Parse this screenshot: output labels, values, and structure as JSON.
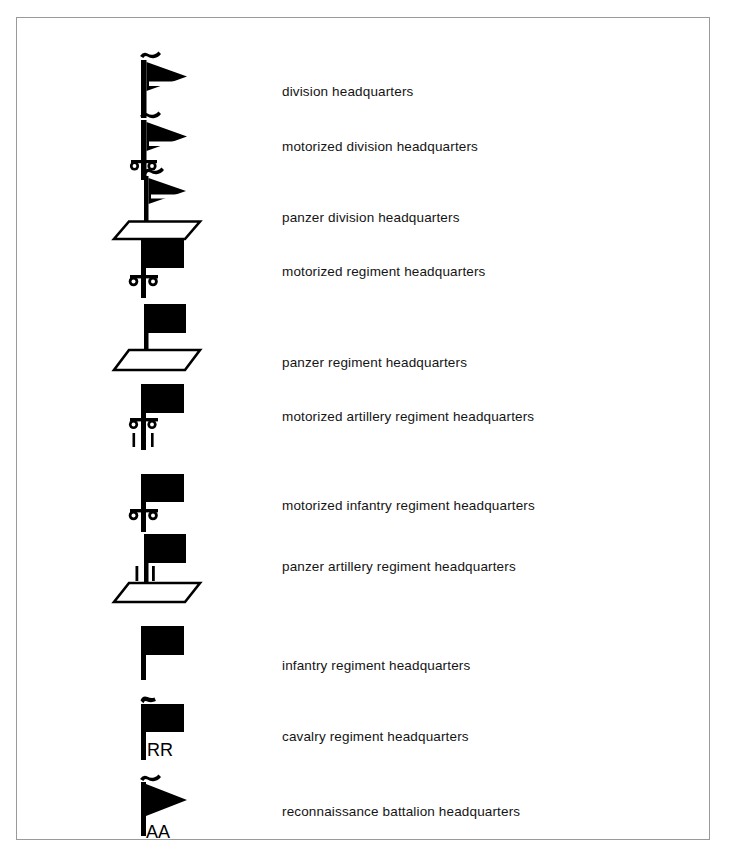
{
  "document": {
    "title": "German military unit headquarters map symbols legend",
    "frame_color": "#9a9a9a",
    "background_color": "#ffffff",
    "ink_color": "#000000"
  },
  "legend": {
    "rows": [
      {
        "symbol": "pennant-flag-striped-with-curl",
        "label": "division headquarters",
        "symbol_y": 38,
        "label_y": 74,
        "height": 62
      },
      {
        "symbol": "pennant-flag-striped-with-curl-motorized",
        "label": "motorized division headquarters",
        "symbol_y": 100,
        "label_y": 129,
        "height": 72
      },
      {
        "symbol": "pennant-flag-striped-with-curl-panzer",
        "label": "panzer division headquarters",
        "symbol_y": 158,
        "label_y": 200,
        "height": 72
      },
      {
        "symbol": "solid-flag-motorized",
        "label": "motorized regiment headquarters",
        "symbol_y": 225,
        "label_y": 254,
        "height": 62
      },
      {
        "symbol": "solid-flag-panzer",
        "label": "panzer regiment headquarters",
        "symbol_y": 290,
        "label_y": 345,
        "height": 80
      },
      {
        "symbol": "solid-flag-motorized-artillery",
        "label": "motorized artillery regiment headquarters",
        "symbol_y": 368,
        "label_y": 399,
        "height": 76
      },
      {
        "symbol": "solid-flag-motorized-infantry",
        "label": "motorized infantry regiment headquarters",
        "symbol_y": 458,
        "label_y": 488,
        "height": 62
      },
      {
        "symbol": "solid-flag-panzer-artillery",
        "label": "panzer artillery regiment headquarters",
        "symbol_y": 518,
        "label_y": 549,
        "height": 82
      },
      {
        "symbol": "solid-flag-plain",
        "label": "infantry regiment headquarters",
        "symbol_y": 610,
        "label_y": 648,
        "height": 62
      },
      {
        "symbol": "solid-flag-cavalry-hook",
        "label": "cavalry regiment headquarters",
        "symbol_y": 683,
        "label_y": 719,
        "height": 70,
        "annotation": "RR"
      },
      {
        "symbol": "solid-pennant-recon-hook",
        "label": "reconnaissance battalion headquarters",
        "symbol_y": 763,
        "label_y": 794,
        "height": 72,
        "annotation": "AA"
      }
    ]
  }
}
